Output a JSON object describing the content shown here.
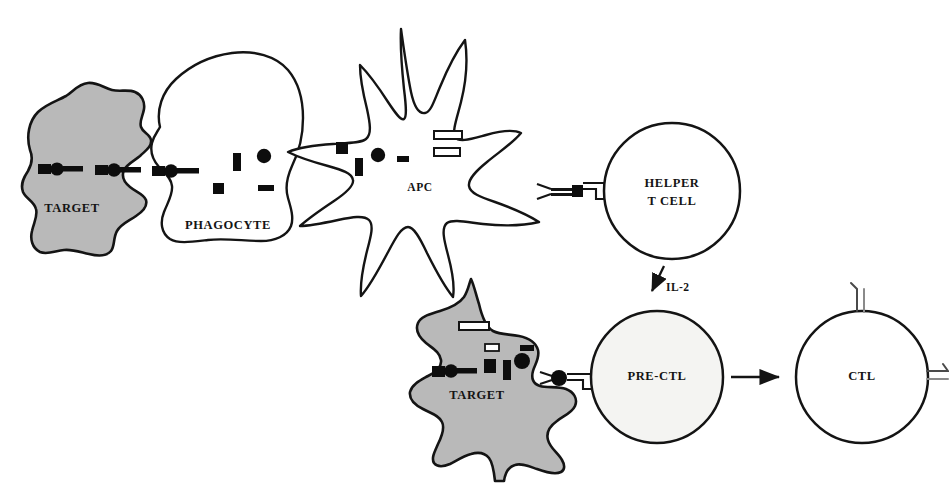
{
  "figure": {
    "background_color": "#ffffff",
    "outline_color": "#141414"
  },
  "palette": {
    "outline": "#141414",
    "target_fill": "#b9b9b9",
    "phagocyte_fill": "#ffffff",
    "apc_fill": "#ffffff",
    "helper_t_fill": "#ffffff",
    "pre_ctl_fill": "#f4f4f2",
    "ctl_fill": "#ffffff",
    "marker_fill": "#0d0d0d",
    "hollow_marker_fill": "#ffffff"
  },
  "cells": {
    "target_upper": {
      "label": "TARGET",
      "shape": "amoeboid-blob",
      "fill": "#b9b9b9"
    },
    "phagocyte": {
      "label": "PHAGOCYTE",
      "shape": "amoeboid-blob",
      "fill": "#ffffff"
    },
    "apc": {
      "label": "APC",
      "shape": "dendritic-star",
      "fill": "#ffffff"
    },
    "helper_t": {
      "label_line1": "HELPER",
      "label_line2": "T CELL",
      "shape": "circle",
      "fill": "#ffffff"
    },
    "target_lower": {
      "label": "TARGET",
      "shape": "amoeboid-blob",
      "fill": "#b9b9b9"
    },
    "pre_ctl": {
      "label": "PRE-CTL",
      "shape": "circle",
      "fill": "#f4f4f2"
    },
    "ctl": {
      "label": "CTL",
      "shape": "circle",
      "fill": "#ffffff"
    }
  },
  "signals": {
    "il2": {
      "label": "IL-2",
      "from": "helper_t",
      "to": "pre_ctl",
      "arrow": "down"
    },
    "maturation": {
      "label": "",
      "from": "pre_ctl",
      "to": "ctl",
      "arrow": "right"
    }
  },
  "markers": {
    "antigen_mhc_complex": "filled rectangle + filled circle + filled bar",
    "hollow_bar": "white rectangle with black outline",
    "filled_square": "solid black square",
    "filled_circle": "solid black circle",
    "filled_bar": "solid black horizontal bar",
    "tcr_receptor": "Y-shaped stem receptor"
  }
}
